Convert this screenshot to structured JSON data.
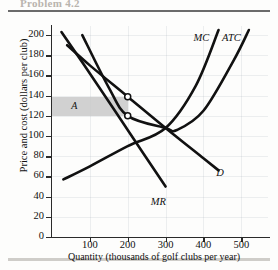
{
  "heading": "Problem 4.2",
  "chart_data": {
    "type": "line",
    "xlabel": "Quantity (thousands of golf clubs per year)",
    "ylabel": "Price and cost (dollars per club)",
    "xlim": [
      0,
      560
    ],
    "ylim": [
      0,
      208
    ],
    "xticks": [
      100,
      200,
      300,
      400,
      500
    ],
    "yticks": [
      0,
      20,
      40,
      60,
      80,
      100,
      120,
      140,
      160,
      180,
      200
    ],
    "grid": true,
    "legend_position": "inline-curve-labels",
    "series": [
      {
        "name": "D",
        "label": "D",
        "description": "Demand curve, downward sloping",
        "x": [
          40,
          100,
          200,
          300,
          400,
          440
        ],
        "y": [
          190,
          170,
          139,
          108,
          78,
          66
        ]
      },
      {
        "name": "MR",
        "label": "MR",
        "description": "Marginal revenue curve, twice as steep as demand",
        "x": [
          25,
          100,
          200,
          300
        ],
        "y": [
          203,
          162,
          106,
          50
        ]
      },
      {
        "name": "MC",
        "label": "MC",
        "description": "Marginal cost curve, U-shaped, rising steeply at high output",
        "x": [
          30,
          100,
          200,
          300,
          380,
          440
        ],
        "y": [
          57,
          70,
          90,
          108,
          150,
          205
        ]
      },
      {
        "name": "ATC",
        "label": "ATC",
        "description": "Average total cost curve, U-shaped with minimum where MC crosses it",
        "x": [
          80,
          150,
          200,
          300,
          330,
          400,
          480,
          520
        ],
        "y": [
          200,
          148,
          120,
          108,
          106,
          125,
          175,
          205
        ]
      }
    ],
    "markers": [
      {
        "label": "price point",
        "x": 200,
        "y": 139
      },
      {
        "label": "average total cost point",
        "x": 200,
        "y": 120
      }
    ],
    "shaded_regions": [
      {
        "label": "A",
        "description": "Economic profit rectangle",
        "x0": 0,
        "x1": 200,
        "y0": 120,
        "y1": 139,
        "color": "#c9c9c9"
      }
    ],
    "annotations": [
      {
        "text": "MC",
        "x": 395,
        "y": 196
      },
      {
        "text": "ATC",
        "x": 470,
        "y": 196
      },
      {
        "text": "D",
        "x": 455,
        "y": 62
      },
      {
        "text": "MR",
        "x": 282,
        "y": 34
      },
      {
        "text": "A",
        "x": 72,
        "y": 129
      }
    ]
  }
}
